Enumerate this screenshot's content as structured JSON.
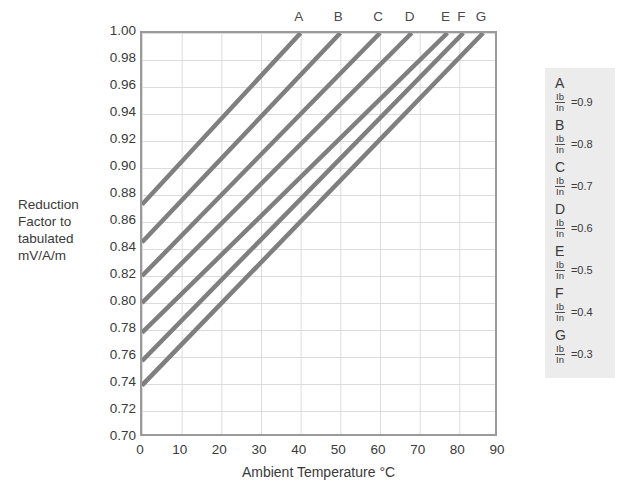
{
  "chart_data": {
    "type": "line",
    "title": "",
    "xlabel": "Ambient Temperature °C",
    "ylabel": "Reduction Factor to tabulated mV/A/m",
    "ylabel_lines": [
      "Reduction",
      "Factor to",
      "tabulated",
      "mV/A/m"
    ],
    "xlim": [
      0,
      90
    ],
    "ylim": [
      0.7,
      1.0
    ],
    "xticks": [
      0,
      10,
      20,
      30,
      40,
      50,
      60,
      70,
      80,
      90
    ],
    "yticks": [
      "1.00",
      "0.98",
      "0.96",
      "0.94",
      "0.92",
      "0.90",
      "0.88",
      "0.86",
      "0.84",
      "0.82",
      "0.80",
      "0.78",
      "0.76",
      "0.74",
      "0.72",
      "0.70"
    ],
    "ytick_values": [
      1.0,
      0.98,
      0.96,
      0.94,
      0.92,
      0.9,
      0.88,
      0.86,
      0.84,
      0.82,
      0.8,
      0.78,
      0.76,
      0.74,
      0.72,
      0.7
    ],
    "grid": true,
    "legend_position": "right",
    "line_color": "#7f7f7f",
    "grid_color": "#dcdcdc",
    "frame_color": "#9a9a9a",
    "legend_bg": "#ececec",
    "series": [
      {
        "name": "A",
        "ratio": "0.9",
        "x": [
          0,
          40
        ],
        "values": [
          0.873,
          1.0
        ],
        "label_x": 40
      },
      {
        "name": "B",
        "ratio": "0.8",
        "x": [
          0,
          50
        ],
        "values": [
          0.845,
          1.0
        ],
        "label_x": 50
      },
      {
        "name": "C",
        "ratio": "0.7",
        "x": [
          0,
          60
        ],
        "values": [
          0.82,
          1.0
        ],
        "label_x": 60
      },
      {
        "name": "D",
        "ratio": "0.6",
        "x": [
          0,
          68
        ],
        "values": [
          0.8,
          1.0
        ],
        "label_x": 68
      },
      {
        "name": "E",
        "ratio": "0.5",
        "x": [
          0,
          77
        ],
        "values": [
          0.778,
          1.0
        ],
        "label_x": 77
      },
      {
        "name": "F",
        "ratio": "0.4",
        "x": [
          0,
          81
        ],
        "values": [
          0.757,
          1.0
        ],
        "label_x": 81
      },
      {
        "name": "G",
        "ratio": "0.3",
        "x": [
          0,
          86
        ],
        "values": [
          0.739,
          1.0
        ],
        "label_x": 86
      }
    ]
  },
  "legend": {
    "items": [
      {
        "key": "A",
        "numerator": "Ib",
        "denominator": "In",
        "value": "=0.9"
      },
      {
        "key": "B",
        "numerator": "Ib",
        "denominator": "In",
        "value": "=0.8"
      },
      {
        "key": "C",
        "numerator": "Ib",
        "denominator": "In",
        "value": "=0.7"
      },
      {
        "key": "D",
        "numerator": "Ib",
        "denominator": "In",
        "value": "=0.6"
      },
      {
        "key": "E",
        "numerator": "Ib",
        "denominator": "In",
        "value": "=0.5"
      },
      {
        "key": "F",
        "numerator": "Ib",
        "denominator": "In",
        "value": "=0.4"
      },
      {
        "key": "G",
        "numerator": "Ib",
        "denominator": "In",
        "value": "=0.3"
      }
    ]
  }
}
